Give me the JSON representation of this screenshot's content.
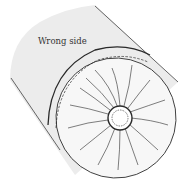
{
  "figure": {
    "label": "Wrong side",
    "colors": {
      "background": "#ffffff",
      "tube": "#ececec",
      "face": "#f7f7f7",
      "line": "#2a2a2a"
    }
  }
}
